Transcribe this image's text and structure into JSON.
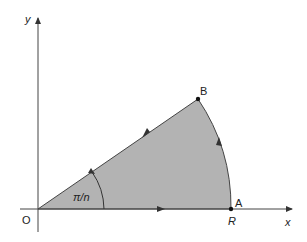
{
  "diagram": {
    "axes": {
      "x_label": "x",
      "y_label": "y",
      "origin_label": "O"
    },
    "points": {
      "A": {
        "label": "A",
        "x": 231,
        "y": 209
      },
      "B": {
        "label": "B",
        "x": 198,
        "y": 99
      },
      "O": {
        "x": 38,
        "y": 209
      }
    },
    "radius_label": "R",
    "angle_label": "π/n",
    "sector_fill": "#b3b3b3",
    "line_color": "#333333"
  }
}
